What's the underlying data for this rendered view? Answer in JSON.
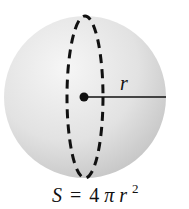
{
  "diagram": {
    "radius_label": "r",
    "formula": {
      "lhs": "S",
      "equals": "=",
      "coefficient": "4",
      "pi": "π",
      "variable": "r",
      "exponent": "2"
    },
    "colors": {
      "sphere_light": "#f4f4f4",
      "sphere_dark": "#c8c8c8",
      "stroke": "#111111"
    }
  }
}
